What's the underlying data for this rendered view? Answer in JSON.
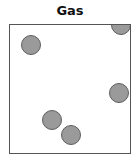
{
  "diagram": {
    "title": "Gas",
    "colors": {
      "particle_fill": "#9a9a9a",
      "particle_stroke": "#5e5e5e",
      "box_border": "#555555"
    },
    "particles": [
      {
        "id": 1,
        "x": 11,
        "y": 10
      },
      {
        "id": 2,
        "x": 101,
        "y": -10
      },
      {
        "id": 3,
        "x": 99,
        "y": 58
      },
      {
        "id": 4,
        "x": 32,
        "y": 85
      },
      {
        "id": 5,
        "x": 51,
        "y": 100
      }
    ]
  }
}
